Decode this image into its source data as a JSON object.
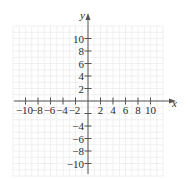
{
  "chart_data": {
    "type": "scatter",
    "title": "",
    "xlabel": "x",
    "ylabel": "y",
    "xlim": [
      -12,
      12
    ],
    "ylim": [
      -12,
      12
    ],
    "grid": true,
    "grid_step": 1,
    "x_ticks": [
      -10,
      -8,
      -6,
      -4,
      -2,
      2,
      4,
      6,
      8,
      10
    ],
    "x_tick_labels": [
      "−10",
      "−8",
      "−6",
      "−4",
      "−2",
      "2",
      "4",
      "6",
      "8",
      "10"
    ],
    "y_ticks": [
      10,
      8,
      6,
      4,
      2,
      -4,
      -6,
      -8,
      -10
    ],
    "y_tick_labels": [
      "10",
      "8",
      "6",
      "4",
      "2",
      "−4",
      "−6",
      "−8",
      "−10"
    ],
    "series": [],
    "legend": null
  },
  "colors": {
    "axis": "#555555",
    "grid": "#ececec",
    "text": "#2b2b2b"
  }
}
